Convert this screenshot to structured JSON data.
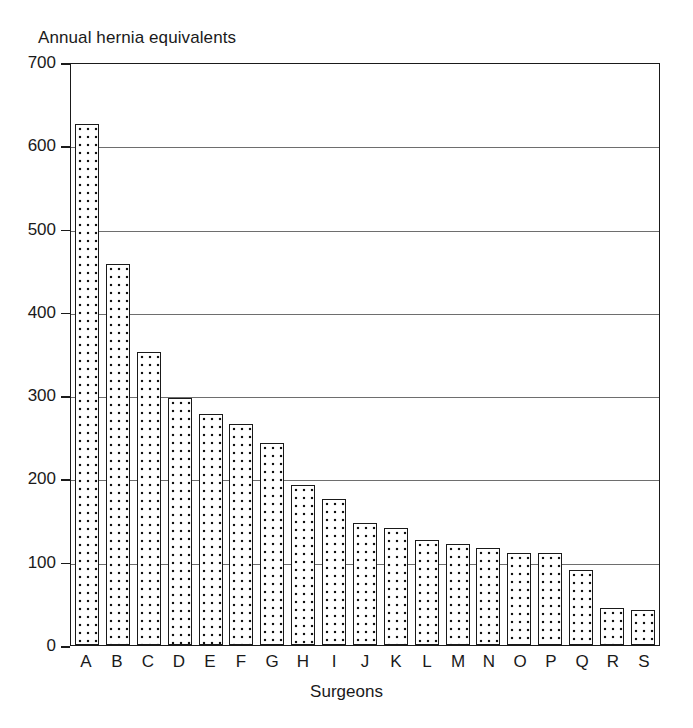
{
  "chart_data": {
    "type": "bar",
    "title": "Annual hernia equivalents",
    "xlabel": "Surgeons",
    "ylabel": "",
    "categories": [
      "A",
      "B",
      "C",
      "D",
      "E",
      "F",
      "G",
      "H",
      "I",
      "J",
      "K",
      "L",
      "M",
      "N",
      "O",
      "P",
      "Q",
      "R",
      "S"
    ],
    "values": [
      625,
      458,
      352,
      296,
      277,
      265,
      243,
      192,
      175,
      146,
      141,
      126,
      121,
      116,
      111,
      111,
      90,
      45,
      42
    ],
    "ylim": [
      0,
      700
    ],
    "y_ticks": [
      0,
      100,
      200,
      300,
      400,
      500,
      600,
      700
    ],
    "y_tick_labels": [
      "0",
      "100",
      "200",
      "300",
      "400",
      "500",
      "600",
      "700"
    ],
    "grid": true,
    "legend": "none",
    "bar_style": "dotted-pattern-fill-black-outline",
    "colors": {
      "bar_fill": "#ffffff",
      "bar_pattern": "#111111",
      "bar_outline": "#1a1a1a",
      "gridline": "#6e6e6e",
      "axis": "#1a1a1a",
      "text": "#1a1a1a",
      "background": "#ffffff"
    }
  }
}
